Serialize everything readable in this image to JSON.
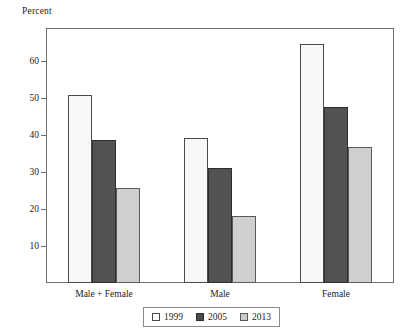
{
  "chart_data": {
    "type": "bar",
    "title": "",
    "subtitle": "",
    "xlabel": "",
    "ylabel": "Percent",
    "categories": [
      "Male + Female",
      "Male",
      "Female"
    ],
    "series": [
      {
        "name": "1999",
        "values": [
          50.8,
          39.2,
          64.6
        ],
        "color": "#f7f7f5"
      },
      {
        "name": "2005",
        "values": [
          38.8,
          31.0,
          47.5
        ],
        "color": "#535353"
      },
      {
        "name": "2013",
        "values": [
          25.8,
          18.0,
          36.7
        ],
        "color": "#cfcfcf"
      }
    ],
    "ylim": [
      0,
      69
    ],
    "yticks": [
      10,
      20,
      30,
      40,
      50,
      60
    ],
    "ytick_labels": [
      "10",
      "20",
      "30",
      "40",
      "50",
      "60"
    ],
    "grid": false,
    "legend_position": "bottom",
    "frame": true
  },
  "axis": {
    "y_caption": "Percent"
  },
  "legend": {
    "items": [
      {
        "label": "1999",
        "swatch": "legend-swatch-1999"
      },
      {
        "label": "2005",
        "swatch": "legend-swatch-2005"
      },
      {
        "label": "2013",
        "swatch": "legend-swatch-2013"
      }
    ]
  }
}
